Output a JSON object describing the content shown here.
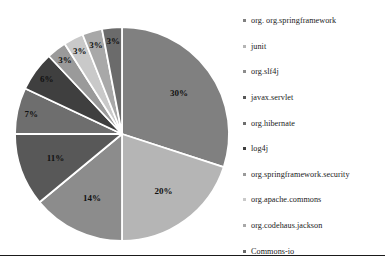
{
  "chart_data": {
    "type": "pie",
    "title": "",
    "legend_position": "right",
    "grid": false,
    "labels_format": "percent",
    "categories": [
      "org. org.springframework",
      "junit",
      "org.slf4j",
      "javax.servlet",
      "org.hibernate",
      "log4j",
      "org.springframework.security",
      "org.apache.commons",
      "org.codehaus.jackson",
      "Commons-io"
    ],
    "values": [
      30,
      20,
      14,
      11,
      7,
      6,
      3,
      3,
      3,
      3
    ],
    "value_labels": [
      "30%",
      "20%",
      "14%",
      "11%",
      "7%",
      "6%",
      "3%",
      "3%",
      "3%",
      "3%"
    ],
    "colors": [
      "#808080",
      "#b5b5b5",
      "#8c8c8c",
      "#585858",
      "#6e6e6e",
      "#3f3f3f",
      "#9a9a9a",
      "#c9c9c9",
      "#a8a8a8",
      "#6b6b6b"
    ],
    "slice_separator_color": "#ffffff",
    "start_angle_deg": 0,
    "direction": "clockwise"
  },
  "legend": {
    "items": [
      {
        "label": "org. org.springframework",
        "color": "#808080"
      },
      {
        "label": "junit",
        "color": "#b5b5b5"
      },
      {
        "label": "org.slf4j",
        "color": "#8c8c8c"
      },
      {
        "label": "javax.servlet",
        "color": "#585858"
      },
      {
        "label": "org.hibernate",
        "color": "#6e6e6e"
      },
      {
        "label": "log4j",
        "color": "#3f3f3f"
      },
      {
        "label": "org.springframework.security",
        "color": "#9a9a9a"
      },
      {
        "label": "org.apache.commons",
        "color": "#c9c9c9"
      },
      {
        "label": "org.codehaus.jackson",
        "color": "#a8a8a8"
      },
      {
        "label": "Commons-io",
        "color": "#6b6b6b"
      }
    ]
  }
}
